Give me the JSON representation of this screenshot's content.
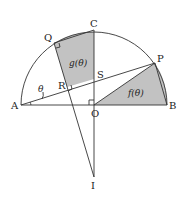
{
  "figure": {
    "points": {
      "A": "A",
      "B": "B",
      "C": "C",
      "O": "O",
      "P": "P",
      "Q": "Q",
      "R": "R",
      "S": "S",
      "I": "I"
    },
    "angle_label": "θ",
    "region_labels": {
      "g": "g(θ)",
      "f": "f(θ)"
    },
    "colors": {
      "shade": "#c2c2c2",
      "line": "#333333"
    }
  }
}
